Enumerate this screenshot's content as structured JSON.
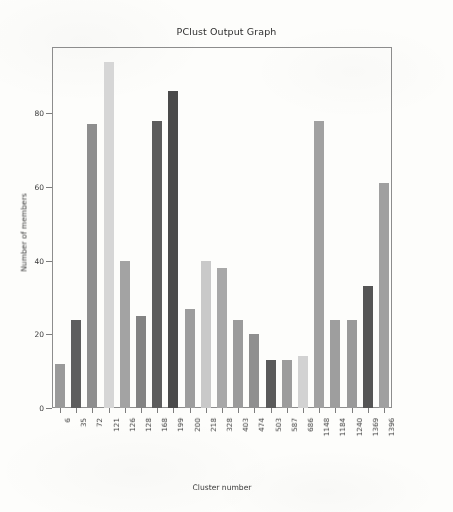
{
  "chart_data": {
    "type": "bar",
    "title": "PClust Output Graph",
    "xlabel": "Cluster number",
    "ylabel": "Number of members",
    "grid": false,
    "legend": null,
    "ylim": [
      0,
      98
    ],
    "yticks": [
      0,
      20,
      40,
      60,
      80
    ],
    "ytick_labels": [
      "0",
      "20",
      "40",
      "60",
      "80"
    ],
    "categories": [
      "6",
      "35",
      "72",
      "121",
      "126",
      "128",
      "168",
      "199",
      "200",
      "218",
      "328",
      "403",
      "474",
      "503",
      "587",
      "686",
      "1148",
      "1184",
      "1240",
      "1369",
      "1396"
    ],
    "tick_categories": [
      "6",
      "35",
      "72",
      "121",
      "126",
      "128",
      "168",
      "199",
      "200",
      "218",
      "328",
      "403",
      "474",
      "503",
      "587",
      "686",
      "1148",
      "1184",
      "1240",
      "1369",
      "1396"
    ],
    "values": [
      12,
      24,
      77,
      94,
      40,
      25,
      78,
      86,
      27,
      40,
      38,
      24,
      20,
      13,
      13,
      14,
      78,
      24,
      24,
      33,
      61
    ],
    "bar_colors": [
      "#9a9a9a",
      "#5e5e5e",
      "#8e8e8e",
      "#d6d6d6",
      "#a3a3a3",
      "#838383",
      "#5c5c5c",
      "#4a4a4a",
      "#9d9d9d",
      "#c9c9c9",
      "#a8a8a8",
      "#9b9b9b",
      "#8f8f8f",
      "#5a5a5a",
      "#9c9c9c",
      "#d2d2d2",
      "#a1a1a1",
      "#9e9e9e",
      "#9a9a9a",
      "#555555",
      "#a0a0a0"
    ]
  },
  "axes": {
    "frame_color": "#8d8d8d",
    "tick_color": "#7d7d7d",
    "text_color": "#3a3a3a"
  }
}
